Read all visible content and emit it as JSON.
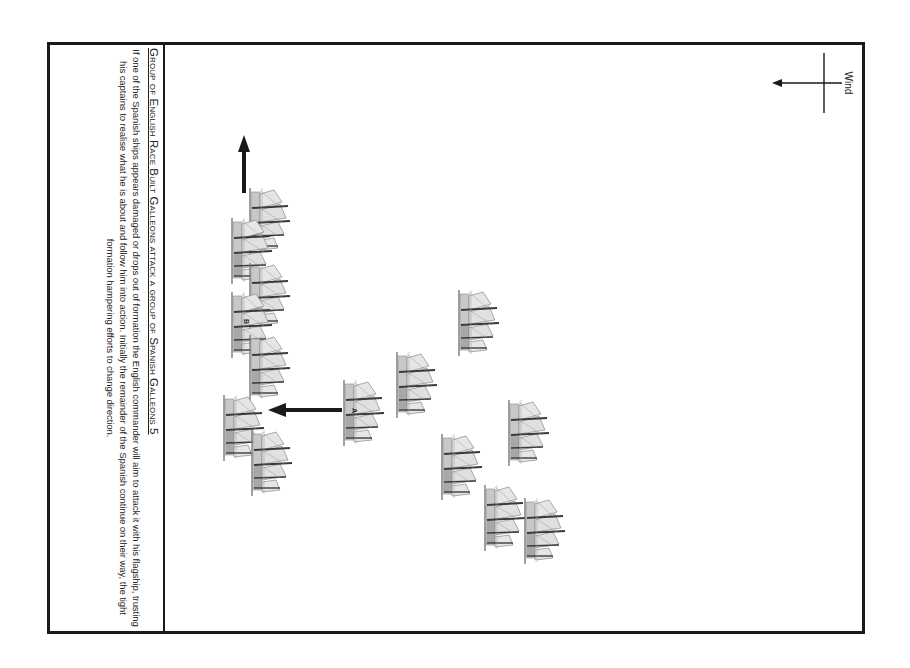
{
  "caption": {
    "title": "Group of English Race Built Galleons attack a group of Spanish Galleons 5",
    "body": "If one of the Spanish ships appears damaged or drops out of formation the English commander will aim to attack it with his flagship, trusting his captains to realise what he is about and follow him into action. Initially the remainder of the Spanish continue on their way, the tight formation hampering efforts to change direction."
  },
  "wind": {
    "label": "Wind",
    "icon": "wind-direction-arrow-icon",
    "direction": "left"
  },
  "ship_labels": {
    "a": "A",
    "b": "B"
  },
  "colors": {
    "frame": "#1a1a1a",
    "ship": "#8a8a8a",
    "ship_dark": "#3a3a3a",
    "arrow": "#1a1a1a"
  },
  "english_ships": [
    {
      "x": 248,
      "y": 188
    },
    {
      "x": 230,
      "y": 218
    },
    {
      "x": 248,
      "y": 263
    },
    {
      "x": 230,
      "y": 292,
      "label": "B"
    },
    {
      "x": 248,
      "y": 335
    },
    {
      "x": 222,
      "y": 395
    },
    {
      "x": 250,
      "y": 430
    }
  ],
  "spanish_ships": [
    {
      "x": 342,
      "y": 380,
      "label": "A"
    },
    {
      "x": 395,
      "y": 352
    },
    {
      "x": 457,
      "y": 290
    },
    {
      "x": 440,
      "y": 434
    },
    {
      "x": 507,
      "y": 400
    },
    {
      "x": 483,
      "y": 485
    },
    {
      "x": 523,
      "y": 498
    }
  ]
}
